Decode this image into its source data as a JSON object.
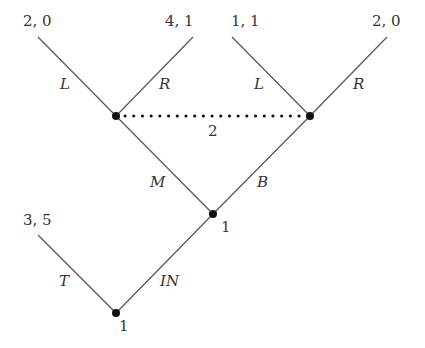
{
  "diagram": {
    "type": "extensive-form game tree",
    "nodes": {
      "root": {
        "player_label": "1"
      },
      "middle": {
        "player_label": "1"
      },
      "info_set": {
        "player_label": "2"
      }
    },
    "actions": {
      "root_left": "T",
      "root_right": "IN",
      "middle_left": "M",
      "middle_right": "B",
      "info_left_node_left": "L",
      "info_left_node_right": "R",
      "info_right_node_left": "L",
      "info_right_node_right": "R"
    },
    "payoffs": {
      "T": "3, 5",
      "M_L": "2, 0",
      "M_R": "4, 1",
      "B_L": "1, 1",
      "B_R": "2, 0"
    }
  }
}
